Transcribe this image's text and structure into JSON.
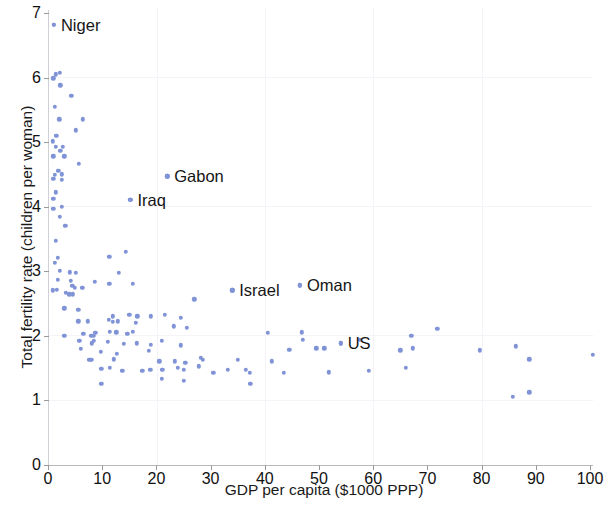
{
  "chart_data": {
    "type": "scatter",
    "title": "",
    "xlabel": "GDP per capita ($1000 PPP)",
    "ylabel": "Total fertility rate (children per woman)",
    "xlim": [
      0,
      103
    ],
    "ylim": [
      0,
      7.15
    ],
    "xticks": [
      0,
      10,
      20,
      30,
      40,
      50,
      60,
      70,
      80,
      90,
      100
    ],
    "yticks": [
      0,
      1,
      2,
      3,
      4,
      5,
      6,
      7
    ],
    "grid": "faint",
    "legend": "none",
    "marker_color": "#7f93d6",
    "annotations": [
      {
        "label": "Niger",
        "x": 1.1,
        "y": 6.82,
        "dx": 7,
        "dy": 0
      },
      {
        "label": "Gabon",
        "x": 22.0,
        "y": 4.47,
        "dx": 7,
        "dy": 0
      },
      {
        "label": "Iraq",
        "x": 15.2,
        "y": 4.1,
        "dx": 7,
        "dy": 0
      },
      {
        "label": "Israel",
        "x": 34.0,
        "y": 2.7,
        "dx": 7,
        "dy": 0
      },
      {
        "label": "Oman",
        "x": 46.5,
        "y": 2.78,
        "dx": 7,
        "dy": 0
      },
      {
        "label": "US",
        "x": 54.0,
        "y": 1.88,
        "dx": 7,
        "dy": 0
      }
    ],
    "points": [
      [
        1.1,
        6.82
      ],
      [
        1.4,
        6.05
      ],
      [
        2.2,
        6.07
      ],
      [
        1.0,
        5.99
      ],
      [
        2.3,
        5.88
      ],
      [
        4.3,
        5.72
      ],
      [
        1.3,
        5.55
      ],
      [
        2.1,
        5.35
      ],
      [
        6.4,
        5.35
      ],
      [
        5.1,
        5.18
      ],
      [
        1.5,
        5.1
      ],
      [
        0.9,
        5.01
      ],
      [
        1.4,
        4.93
      ],
      [
        2.7,
        4.93
      ],
      [
        2.3,
        4.86
      ],
      [
        1.0,
        4.78
      ],
      [
        3.0,
        4.78
      ],
      [
        5.7,
        4.66
      ],
      [
        1.9,
        4.55
      ],
      [
        1.3,
        4.49
      ],
      [
        2.5,
        4.5
      ],
      [
        1.0,
        4.43
      ],
      [
        2.6,
        4.41
      ],
      [
        1.4,
        4.22
      ],
      [
        1.0,
        4.12
      ],
      [
        15.2,
        4.1
      ],
      [
        22.0,
        4.47
      ],
      [
        2.6,
        4.0
      ],
      [
        1.0,
        3.96
      ],
      [
        2.2,
        3.84
      ],
      [
        3.2,
        3.7
      ],
      [
        1.4,
        3.47
      ],
      [
        1.8,
        3.2
      ],
      [
        1.2,
        3.13
      ],
      [
        11.3,
        3.22
      ],
      [
        14.3,
        3.3
      ],
      [
        2.2,
        3.0
      ],
      [
        4.0,
        2.98
      ],
      [
        5.1,
        2.97
      ],
      [
        13.1,
        2.97
      ],
      [
        1.8,
        2.86
      ],
      [
        4.2,
        2.85
      ],
      [
        8.6,
        2.83
      ],
      [
        11.3,
        2.8
      ],
      [
        15.6,
        2.8
      ],
      [
        4.5,
        2.77
      ],
      [
        5.0,
        2.74
      ],
      [
        6.3,
        2.74
      ],
      [
        46.5,
        2.78
      ],
      [
        0.9,
        2.7
      ],
      [
        1.6,
        2.71
      ],
      [
        3.3,
        2.66
      ],
      [
        3.9,
        2.64
      ],
      [
        4.6,
        2.64
      ],
      [
        34.0,
        2.7
      ],
      [
        27.0,
        2.56
      ],
      [
        3.0,
        2.42
      ],
      [
        5.6,
        2.4
      ],
      [
        12.0,
        2.3
      ],
      [
        15.0,
        2.32
      ],
      [
        16.5,
        2.3
      ],
      [
        19.0,
        2.3
      ],
      [
        21.5,
        2.32
      ],
      [
        24.5,
        2.27
      ],
      [
        5.6,
        2.22
      ],
      [
        7.4,
        2.22
      ],
      [
        11.2,
        2.24
      ],
      [
        12.0,
        2.21
      ],
      [
        12.9,
        2.22
      ],
      [
        16.2,
        2.2
      ],
      [
        23.2,
        2.14
      ],
      [
        25.6,
        2.12
      ],
      [
        3.0,
        2.0
      ],
      [
        6.5,
        2.03
      ],
      [
        8.0,
        2.0
      ],
      [
        8.4,
        2.0
      ],
      [
        8.7,
        2.04
      ],
      [
        11.4,
        2.06
      ],
      [
        12.6,
        2.05
      ],
      [
        14.6,
        2.03
      ],
      [
        15.6,
        2.06
      ],
      [
        40.5,
        2.04
      ],
      [
        46.8,
        2.05
      ],
      [
        5.8,
        1.92
      ],
      [
        8.1,
        1.88
      ],
      [
        8.4,
        1.92
      ],
      [
        11.0,
        1.9
      ],
      [
        14.0,
        1.87
      ],
      [
        16.4,
        1.88
      ],
      [
        19.0,
        1.86
      ],
      [
        21.0,
        1.92
      ],
      [
        24.5,
        1.85
      ],
      [
        47.0,
        1.93
      ],
      [
        54.0,
        1.88
      ],
      [
        57.5,
        1.93
      ],
      [
        49.5,
        1.8
      ],
      [
        6.0,
        1.79
      ],
      [
        9.7,
        1.75
      ],
      [
        12.7,
        1.72
      ],
      [
        18.6,
        1.76
      ],
      [
        44.5,
        1.78
      ],
      [
        51.0,
        1.8
      ],
      [
        65.0,
        1.77
      ],
      [
        67.3,
        1.8
      ],
      [
        79.7,
        1.77
      ],
      [
        86.3,
        1.83
      ],
      [
        100.5,
        1.7
      ],
      [
        7.6,
        1.62
      ],
      [
        8.0,
        1.62
      ],
      [
        12.1,
        1.63
      ],
      [
        20.5,
        1.6
      ],
      [
        23.4,
        1.6
      ],
      [
        25.3,
        1.58
      ],
      [
        28.2,
        1.65
      ],
      [
        28.6,
        1.62
      ],
      [
        35.0,
        1.62
      ],
      [
        41.3,
        1.6
      ],
      [
        88.8,
        1.63
      ],
      [
        9.8,
        1.48
      ],
      [
        11.4,
        1.5
      ],
      [
        13.7,
        1.45
      ],
      [
        17.4,
        1.45
      ],
      [
        18.9,
        1.47
      ],
      [
        21.1,
        1.47
      ],
      [
        24.0,
        1.5
      ],
      [
        25.0,
        1.47
      ],
      [
        27.8,
        1.52
      ],
      [
        30.5,
        1.42
      ],
      [
        33.2,
        1.47
      ],
      [
        36.5,
        1.47
      ],
      [
        37.2,
        1.42
      ],
      [
        43.5,
        1.42
      ],
      [
        51.8,
        1.43
      ],
      [
        59.2,
        1.45
      ],
      [
        66.0,
        1.5
      ],
      [
        71.8,
        2.1
      ],
      [
        67.0,
        2.0
      ],
      [
        21.0,
        1.33
      ],
      [
        25.0,
        1.3
      ],
      [
        37.3,
        1.25
      ],
      [
        9.8,
        1.25
      ],
      [
        85.8,
        1.05
      ],
      [
        88.8,
        1.12
      ]
    ]
  }
}
